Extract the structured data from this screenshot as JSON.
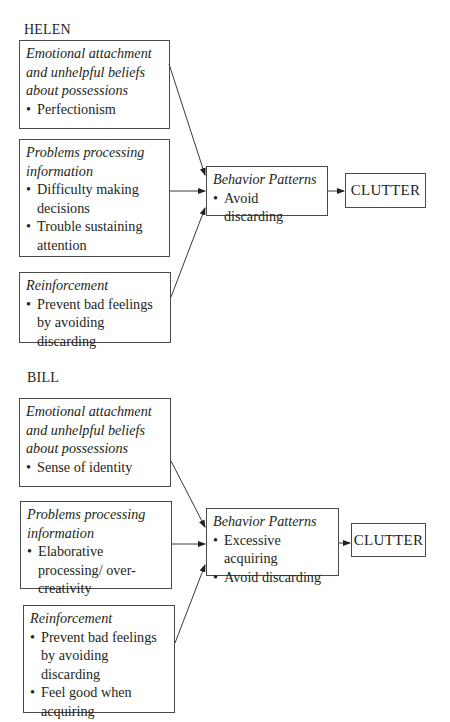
{
  "diagrams": [
    {
      "name": "HELEN",
      "factors": [
        {
          "title": "Emotional attachment and unhelpful beliefs about possessions",
          "title_lines": [
            "Emotional attachment",
            "and unhelpful beliefs",
            "about possessions"
          ],
          "bullets": [
            "Perfectionism"
          ]
        },
        {
          "title": "Problems processing information",
          "title_lines": [
            "Problems processing",
            "information"
          ],
          "bullets": [
            "Difficulty making decisions",
            "Trouble sustaining attention"
          ]
        },
        {
          "title": "Reinforcement",
          "title_lines": [
            "Reinforcement"
          ],
          "bullets": [
            "Prevent bad feelings by avoiding discarding"
          ]
        }
      ],
      "behavior": {
        "title": "Behavior Patterns",
        "bullets": [
          "Avoid discarding"
        ]
      },
      "outcome": "CLUTTER"
    },
    {
      "name": "BILL",
      "factors": [
        {
          "title": "Emotional attachment and unhelpful beliefs about possessions",
          "title_lines": [
            "Emotional attachment",
            "and unhelpful beliefs",
            "about possessions"
          ],
          "bullets": [
            "Sense of identity"
          ]
        },
        {
          "title": "Problems processing information",
          "title_lines": [
            "Problems processing",
            "information"
          ],
          "bullets": [
            "Elaborative processing/ over-creativity"
          ]
        },
        {
          "title": "Reinforcement",
          "title_lines": [
            "Reinforcement"
          ],
          "bullets": [
            "Prevent bad feelings by avoiding discarding",
            "Feel good when acquiring"
          ]
        }
      ],
      "behavior": {
        "title": "Behavior Patterns",
        "bullets": [
          "Excessive acquiring",
          "Avoid discarding"
        ]
      },
      "outcome": "CLUTTER"
    }
  ]
}
